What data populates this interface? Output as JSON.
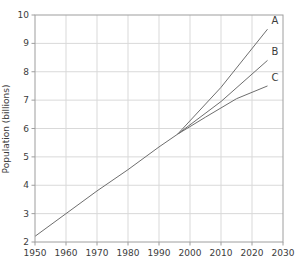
{
  "chart_data": {
    "type": "line",
    "title": "",
    "xlabel": "",
    "ylabel": "Population (billions)",
    "xlim": [
      1950,
      2030
    ],
    "ylim": [
      2,
      10
    ],
    "xticks": [
      1950,
      1960,
      1970,
      1980,
      1990,
      2000,
      2010,
      2020,
      2030
    ],
    "yticks": [
      2,
      3,
      4,
      5,
      6,
      7,
      8,
      9,
      10
    ],
    "grid": true,
    "legend_position": "none",
    "series": [
      {
        "name": "history",
        "label": "",
        "x": [
          1950,
          1960,
          1970,
          1980,
          1990,
          1996
        ],
        "y": [
          2.2,
          3.0,
          3.8,
          4.55,
          5.35,
          5.8
        ]
      },
      {
        "name": "A",
        "label": "A",
        "x": [
          1996,
          2010,
          2025
        ],
        "y": [
          5.8,
          7.45,
          9.5
        ]
      },
      {
        "name": "B",
        "label": "B",
        "x": [
          1996,
          2010,
          2025
        ],
        "y": [
          5.8,
          6.95,
          8.4
        ]
      },
      {
        "name": "C",
        "label": "C",
        "x": [
          1996,
          2005,
          2015,
          2025
        ],
        "y": [
          5.8,
          6.4,
          7.05,
          7.5
        ]
      }
    ],
    "colors": {
      "line": "#6e6e6e",
      "grid": "#d9d9d9",
      "axis": "#9e9e9e",
      "text": "#3c3c3c",
      "background": "#ffffff"
    }
  }
}
